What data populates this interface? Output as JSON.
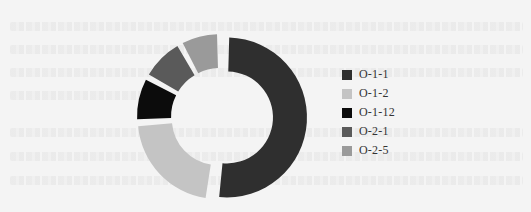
{
  "chart_data": {
    "type": "pie",
    "variant": "donut",
    "title": "",
    "categories": [
      "O-1-1",
      "O-1-2",
      "O-1-12",
      "O-2-1",
      "O-2-5"
    ],
    "values": [
      52,
      22,
      9,
      9,
      8
    ],
    "colors": [
      "#2f2f2f",
      "#c4c4c4",
      "#0c0c0c",
      "#5a5a5a",
      "#9a9a9a"
    ],
    "exploded": true,
    "legend_position": "right",
    "grid": false
  },
  "legend": {
    "items": [
      {
        "label": "O-1-1",
        "color": "#2f2f2f"
      },
      {
        "label": "O-1-2",
        "color": "#c4c4c4"
      },
      {
        "label": "O-1-12",
        "color": "#0c0c0c"
      },
      {
        "label": "O-2-1",
        "color": "#5a5a5a"
      },
      {
        "label": "O-2-5",
        "color": "#9a9a9a"
      }
    ]
  }
}
